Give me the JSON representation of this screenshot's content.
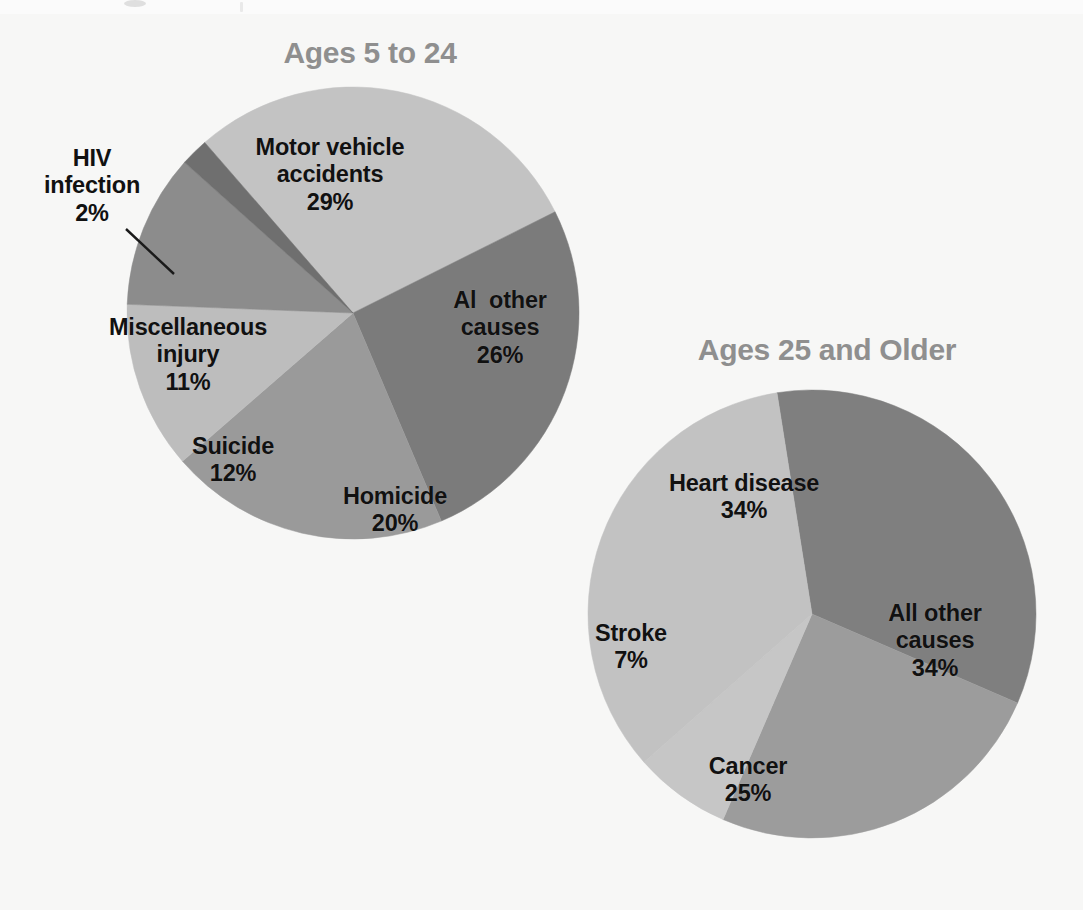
{
  "figure": {
    "background_color": "#f7f7f6",
    "label_color": "#111111",
    "title_color": "#8f8f8f"
  },
  "chart_data": [
    {
      "type": "pie",
      "title": "Ages 5 to 24",
      "chart_id": "ages-5-to-24",
      "center": [
        353,
        313
      ],
      "radius": 226,
      "start_angle_deg": -41,
      "categories": [
        "Motor vehicle accidents",
        "Al  other causes",
        "Homicide",
        "Suicide",
        "Miscellaneous injury",
        "HIV infection"
      ],
      "values": [
        29,
        26,
        20,
        12,
        11,
        2
      ],
      "colors": [
        "#c3c3c3",
        "#7b7b7b",
        "#9a9a9a",
        "#bdbdbd",
        "#8c8c8c",
        "#6f6f6f"
      ],
      "slices": [
        {
          "name": "Motor vehicle accidents",
          "label_lines": [
            "Motor vehicle",
            "accidents"
          ],
          "value_label": "29%",
          "value": 29,
          "color": "#c3c3c3",
          "label_pos": [
            330,
            175
          ],
          "external": false
        },
        {
          "name": "Al  other causes",
          "label_lines": [
            "Al  other",
            "causes"
          ],
          "value_label": "26%",
          "value": 26,
          "color": "#7b7b7b",
          "label_pos": [
            500,
            328
          ],
          "external": false
        },
        {
          "name": "Homicide",
          "label_lines": [
            "Homicide"
          ],
          "value_label": "20%",
          "value": 20,
          "color": "#9a9a9a",
          "label_pos": [
            395,
            510
          ],
          "external": false
        },
        {
          "name": "Suicide",
          "label_lines": [
            "Suicide"
          ],
          "value_label": "12%",
          "value": 12,
          "color": "#bdbdbd",
          "label_pos": [
            233,
            460
          ],
          "external": false
        },
        {
          "name": "Miscellaneous injury",
          "label_lines": [
            "Miscellaneous",
            "injury"
          ],
          "value_label": "11%",
          "value": 11,
          "color": "#8c8c8c",
          "label_pos": [
            188,
            355
          ],
          "external": false
        },
        {
          "name": "HIV infection",
          "label_lines": [
            "HIV",
            "infection"
          ],
          "value_label": "2%",
          "value": 2,
          "color": "#6f6f6f",
          "label_pos": [
            92,
            186
          ],
          "external": true,
          "leader": [
            [
              126,
              229
            ],
            [
              172,
              272
            ]
          ]
        }
      ],
      "title_pos": [
        370,
        52
      ],
      "legend": "none",
      "grid": false
    },
    {
      "type": "pie",
      "title": "Ages 25 and Older",
      "chart_id": "ages-25-and-older",
      "center": [
        812,
        614
      ],
      "radius": 224,
      "start_angle_deg": -9,
      "categories": [
        "All other causes",
        "Cancer",
        "Stroke",
        "Heart disease"
      ],
      "values": [
        34,
        25,
        7,
        34
      ],
      "colors": [
        "#7f7f7f",
        "#9c9c9c",
        "#c6c6c6",
        "#c2c2c2"
      ],
      "slices": [
        {
          "name": "All other causes",
          "label_lines": [
            "All other",
            "causes"
          ],
          "value_label": "34%",
          "value": 34,
          "color": "#7f7f7f",
          "label_pos": [
            935,
            641
          ],
          "external": false
        },
        {
          "name": "Cancer",
          "label_lines": [
            "Cancer"
          ],
          "value_label": "25%",
          "value": 25,
          "color": "#9c9c9c",
          "label_pos": [
            748,
            780
          ],
          "external": false
        },
        {
          "name": "Stroke",
          "label_lines": [
            "Stroke"
          ],
          "value_label": "7%",
          "value": 7,
          "color": "#c6c6c6",
          "label_pos": [
            631,
            647
          ],
          "external": false
        },
        {
          "name": "Heart disease",
          "label_lines": [
            "Heart disease"
          ],
          "value_label": "34%",
          "value": 34,
          "color": "#c2c2c2",
          "label_pos": [
            744,
            497
          ],
          "external": false
        }
      ],
      "title_pos": [
        827,
        333
      ],
      "legend": "none",
      "grid": false
    }
  ]
}
